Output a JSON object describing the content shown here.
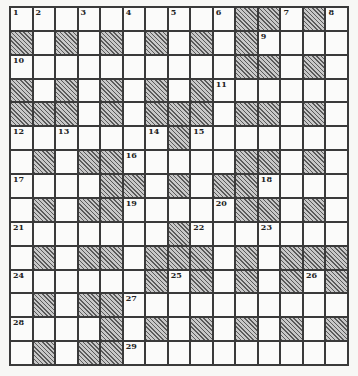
{
  "puzzle": {
    "columns": 15,
    "rows": 15,
    "colors": {
      "border": "#3a3a3a",
      "cell": "#fbfbfa",
      "block_hatch_dark": "#5a5a5a",
      "block_hatch_light": "#c8c8c8",
      "number": "#222222"
    },
    "grid": [
      [
        "1",
        "2",
        "",
        "3",
        "",
        "4",
        "",
        "5",
        "",
        "6",
        "#",
        "#",
        "7",
        "#",
        "8"
      ],
      [
        "#",
        "",
        "#",
        "",
        "#",
        "",
        "#",
        "",
        "#",
        "",
        "#",
        "9",
        "",
        "",
        ""
      ],
      [
        "10",
        "",
        "",
        "",
        "",
        "",
        "",
        "",
        "",
        "",
        "#",
        "#",
        "",
        "#",
        ""
      ],
      [
        "#",
        "",
        "#",
        "",
        "#",
        "",
        "#",
        "",
        "#",
        "11",
        "",
        "",
        "",
        "",
        ""
      ],
      [
        "#",
        "#",
        "#",
        "",
        "#",
        "",
        "#",
        "#",
        "#",
        "",
        "#",
        "#",
        "",
        "#",
        ""
      ],
      [
        "12",
        "",
        "13",
        "",
        "",
        "",
        "14",
        "#",
        "15",
        "",
        "",
        "",
        "",
        "",
        ""
      ],
      [
        "",
        "#",
        "",
        "#",
        "#",
        "16",
        "",
        "",
        "",
        "",
        "#",
        "#",
        "",
        "#",
        ""
      ],
      [
        "17",
        "",
        "",
        "",
        "#",
        "#",
        "",
        "#",
        "",
        "#",
        "#",
        "18",
        "",
        "",
        ""
      ],
      [
        "",
        "#",
        "",
        "#",
        "#",
        "19",
        "",
        "",
        "",
        "20",
        "#",
        "#",
        "",
        "#",
        ""
      ],
      [
        "21",
        "",
        "",
        "",
        "",
        "",
        "",
        "#",
        "22",
        "",
        "",
        "23",
        "",
        "",
        ""
      ],
      [
        "",
        "#",
        "",
        "#",
        "#",
        "",
        "#",
        "#",
        "#",
        "",
        "#",
        "",
        "#",
        "#",
        "#"
      ],
      [
        "24",
        "",
        "",
        "",
        "",
        "",
        "#",
        "25",
        "#",
        "",
        "#",
        "",
        "#",
        "26",
        "#"
      ],
      [
        "",
        "#",
        "",
        "#",
        "#",
        "27",
        "",
        "",
        "",
        "",
        "",
        "",
        "",
        "",
        ""
      ],
      [
        "28",
        "",
        "",
        "",
        "#",
        "",
        "#",
        "",
        "#",
        "",
        "#",
        "",
        "#",
        "",
        "#"
      ],
      [
        "",
        "#",
        "",
        "#",
        "#",
        "29",
        "",
        "",
        "",
        "",
        "",
        "",
        "",
        "",
        ""
      ]
    ]
  }
}
